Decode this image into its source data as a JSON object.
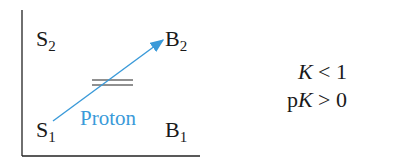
{
  "diagram": {
    "species": {
      "s2": {
        "base": "S",
        "sub": "2"
      },
      "b2": {
        "base": "B",
        "sub": "2"
      },
      "s1": {
        "base": "S",
        "sub": "1"
      },
      "b1": {
        "base": "B",
        "sub": "1"
      }
    },
    "arrow_label": "Proton",
    "arrow_color": "#3a9ad9",
    "equilibrium_symbol": "="
  },
  "conditions": {
    "line1": {
      "var": "K",
      "op": " < ",
      "val": "1"
    },
    "line2": {
      "prefix": "p",
      "var": "K",
      "op": " > ",
      "val": "0"
    }
  }
}
